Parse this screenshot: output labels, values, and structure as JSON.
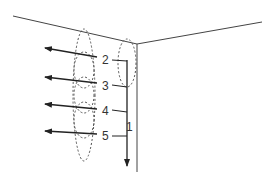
{
  "diagram": {
    "type": "airflow-corner-vortex",
    "colors": {
      "line": "#444444",
      "dashed": "#555555",
      "text": "#333333",
      "background": "#ffffff"
    },
    "labels": [
      {
        "id": "1",
        "text": "1",
        "x": 129,
        "y": 129
      },
      {
        "id": "2",
        "text": "2",
        "x": 102,
        "y": 64
      },
      {
        "id": "3",
        "text": "3",
        "x": 102,
        "y": 90
      },
      {
        "id": "4",
        "text": "4",
        "x": 102,
        "y": 115
      },
      {
        "id": "5",
        "text": "5",
        "x": 102,
        "y": 140
      }
    ]
  }
}
